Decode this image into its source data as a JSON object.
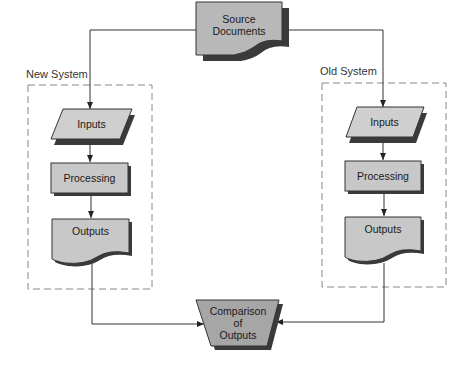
{
  "diagram": {
    "colors": {
      "shape_fill": "#c8c8c8",
      "shape_fill_dark": "#a9a9a9",
      "shadow": "#3a3a3a",
      "line": "#333333",
      "dashed_border": "#888888"
    },
    "source": {
      "line1": "Source",
      "line2": "Documents"
    },
    "new_system": {
      "title": "New System",
      "inputs": "Inputs",
      "processing": "Processing",
      "outputs": "Outputs"
    },
    "old_system": {
      "title": "Old System",
      "inputs": "Inputs",
      "processing": "Processing",
      "outputs": "Outputs"
    },
    "comparison": {
      "line1": "Comparison",
      "line2": "of",
      "line3": "Outputs"
    }
  }
}
